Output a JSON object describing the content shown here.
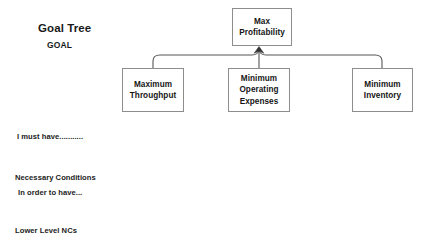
{
  "diagram": {
    "title": "Goal Tree",
    "subtitle": "GOAL",
    "legend": {
      "must_have": "I must have...........",
      "necessary_conditions": "Necessary Conditions",
      "in_order_to_have": "In order to have...",
      "lower_level_ncs": "Lower Level NCs"
    },
    "colors": {
      "box_border": "#8d8d8d",
      "box_fill": "#ffffff",
      "connector": "#555555",
      "text": "#151515",
      "background": "#ffffff"
    },
    "nodes": {
      "goal": "Max\nProfitability",
      "nc1": "Maximum\nThroughput",
      "nc2": "Minimum\nOperating\nExpenses",
      "nc3": "Minimum\nInventory"
    }
  }
}
